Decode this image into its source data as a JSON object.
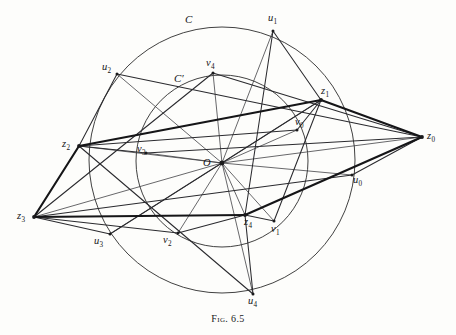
{
  "figure": {
    "caption_prefix": "Fig.",
    "caption_number": "6.5",
    "caption_full": "Fig. 6.5",
    "width": 456,
    "height": 335,
    "background_color": "#fdfdfb",
    "ink_color": "#1a1a1c"
  },
  "circles": [
    {
      "name": "C",
      "label": "C",
      "label_x": 185,
      "label_y": 14,
      "cx": 222,
      "cy": 160,
      "r": 133,
      "role": "outer-circle"
    },
    {
      "name": "C'",
      "label": "C′",
      "label_x": 174,
      "label_y": 73,
      "cx": 222,
      "cy": 161,
      "r": 86,
      "role": "inner-circle"
    }
  ],
  "center_point": {
    "name": "O",
    "label": "O",
    "x": 222,
    "y": 163,
    "label_x": 203,
    "label_y": 158
  },
  "points": [
    {
      "name": "z0",
      "base": "z",
      "sub": "0",
      "x": 422,
      "y": 137,
      "label_x": 427,
      "label_y": 131,
      "group": "z"
    },
    {
      "name": "z1",
      "base": "z",
      "sub": "1",
      "x": 321,
      "y": 100,
      "label_x": 321,
      "label_y": 86,
      "group": "z"
    },
    {
      "name": "z2",
      "base": "z",
      "sub": "2",
      "x": 79,
      "y": 146,
      "label_x": 62,
      "label_y": 139,
      "group": "z"
    },
    {
      "name": "z3",
      "base": "z",
      "sub": "3",
      "x": 34,
      "y": 217,
      "label_x": 17,
      "label_y": 211,
      "group": "z"
    },
    {
      "name": "z4",
      "base": "z",
      "sub": "4",
      "x": 245,
      "y": 215,
      "label_x": 244,
      "label_y": 217,
      "group": "z"
    },
    {
      "name": "u0",
      "base": "u",
      "sub": "0",
      "x": 352,
      "y": 175,
      "label_x": 353,
      "label_y": 175,
      "group": "u"
    },
    {
      "name": "u1",
      "base": "u",
      "sub": "1",
      "x": 273,
      "y": 31,
      "label_x": 268,
      "label_y": 13,
      "group": "u"
    },
    {
      "name": "u2",
      "base": "u",
      "sub": "2",
      "x": 117,
      "y": 74,
      "label_x": 102,
      "label_y": 62,
      "group": "u"
    },
    {
      "name": "u3",
      "base": "u",
      "sub": "3",
      "x": 110,
      "y": 234,
      "label_x": 94,
      "label_y": 236,
      "group": "u"
    },
    {
      "name": "u4",
      "base": "u",
      "sub": "4",
      "x": 253,
      "y": 294,
      "label_x": 248,
      "label_y": 296,
      "group": "u"
    },
    {
      "name": "v0",
      "base": "v",
      "sub": "0",
      "x": 297,
      "y": 130,
      "label_x": 295,
      "label_y": 117,
      "group": "v"
    },
    {
      "name": "v1",
      "base": "v",
      "sub": "1",
      "x": 274,
      "y": 221,
      "label_x": 271,
      "label_y": 224,
      "group": "v"
    },
    {
      "name": "v2",
      "base": "v",
      "sub": "2",
      "x": 178,
      "y": 233,
      "label_x": 163,
      "label_y": 235,
      "group": "v"
    },
    {
      "name": "v3",
      "base": "v",
      "sub": "3",
      "x": 146,
      "y": 153,
      "label_x": 137,
      "label_y": 144,
      "group": "v"
    },
    {
      "name": "v4",
      "base": "v",
      "sub": "4",
      "x": 213,
      "y": 73,
      "label_x": 206,
      "label_y": 58,
      "group": "v"
    }
  ],
  "segments": {
    "thick_outline": [
      [
        "z0",
        "z1"
      ],
      [
        "z1",
        "z2"
      ],
      [
        "z2",
        "z3"
      ],
      [
        "z3",
        "z4"
      ],
      [
        "z4",
        "z0"
      ]
    ],
    "radii_from_center": [
      [
        "O",
        "z0"
      ],
      [
        "O",
        "z1"
      ],
      [
        "O",
        "z2"
      ],
      [
        "O",
        "z3"
      ],
      [
        "O",
        "z4"
      ],
      [
        "O",
        "u0"
      ],
      [
        "O",
        "u1"
      ],
      [
        "O",
        "u2"
      ],
      [
        "O",
        "u3"
      ],
      [
        "O",
        "u4"
      ],
      [
        "O",
        "v0"
      ],
      [
        "O",
        "v1"
      ],
      [
        "O",
        "v2"
      ],
      [
        "O",
        "v3"
      ],
      [
        "O",
        "v4"
      ]
    ],
    "u_chords": [
      [
        "u1",
        "z1"
      ],
      [
        "u1",
        "z4"
      ],
      [
        "u2",
        "z2"
      ],
      [
        "u2",
        "z0"
      ],
      [
        "u3",
        "z3"
      ],
      [
        "u3",
        "z1"
      ],
      [
        "u4",
        "z4"
      ],
      [
        "u4",
        "z2"
      ],
      [
        "u0",
        "z0"
      ],
      [
        "u0",
        "z3"
      ]
    ],
    "v_chords": [
      [
        "v0",
        "z1"
      ],
      [
        "v0",
        "z2"
      ],
      [
        "v1",
        "z4"
      ],
      [
        "v1",
        "z1"
      ],
      [
        "v2",
        "z4"
      ],
      [
        "v2",
        "z3"
      ],
      [
        "v3",
        "z2"
      ],
      [
        "v3",
        "z0"
      ],
      [
        "v4",
        "z0"
      ],
      [
        "v4",
        "z3"
      ]
    ]
  }
}
